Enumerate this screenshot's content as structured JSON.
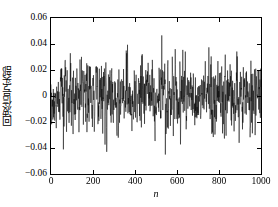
{
  "chart_data": {
    "type": "line",
    "title": "",
    "xlabel": "n",
    "ylabel": "回波信号实部",
    "xlim": [
      0,
      1000
    ],
    "ylim": [
      -0.06,
      0.06
    ],
    "xticks": [
      0,
      200,
      400,
      600,
      800,
      1000
    ],
    "xtick_labels": [
      "0",
      "200",
      "400",
      "600",
      "800",
      "1000"
    ],
    "yticks": [
      -0.06,
      -0.04,
      -0.02,
      0,
      0.02,
      0.04,
      0.06
    ],
    "ytick_labels": [
      "−0.06",
      "−0.04",
      "−0.02",
      "0",
      "0.02",
      "0.04",
      "0.06"
    ],
    "grid": false,
    "legend": null,
    "line_color": "#000000",
    "line_width": 0.5,
    "n_points": 1000,
    "series": [
      {
        "name": "echo-signal-real-part",
        "description": "Dense noise-like echo signal, zero-mean, amplitude mostly within +/-0.03 with occasional spikes to +/-0.05",
        "rms": 0.013,
        "peak_positive": 0.046,
        "peak_negative": -0.055,
        "envelope": [
          0.018,
          0.022,
          0.031,
          0.026,
          0.034,
          0.021,
          0.028,
          0.033,
          0.024,
          0.03,
          0.036,
          0.025,
          0.029,
          0.038,
          0.027,
          0.023,
          0.032,
          0.035,
          0.026,
          0.03,
          0.024,
          0.033,
          0.028,
          0.037,
          0.022,
          0.031,
          0.026,
          0.034,
          0.029,
          0.023,
          0.035,
          0.027,
          0.032,
          0.025,
          0.038,
          0.028,
          0.022,
          0.033,
          0.03,
          0.026
        ]
      }
    ]
  },
  "figure": {
    "background": "#ffffff",
    "axis_color": "#000000"
  }
}
